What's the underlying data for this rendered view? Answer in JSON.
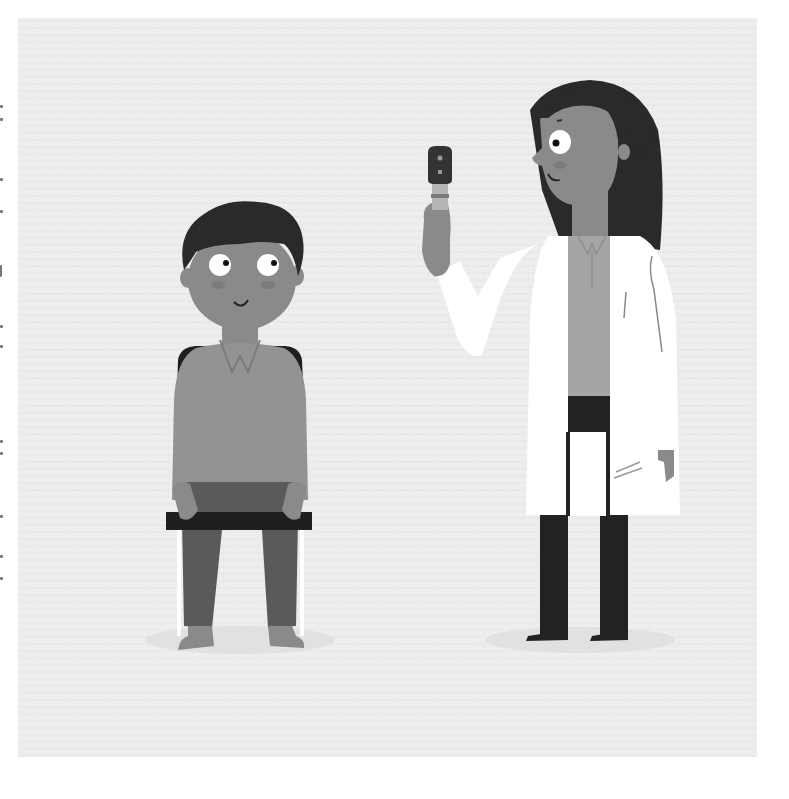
{
  "illustration": {
    "description": "Grayscale illustration of a boy seated on a chair and a female doctor in a white lab coat holding an ophthalmoscope",
    "background_color": "#eeeeee",
    "page_color": "#ffffff",
    "colors": {
      "skin": "#8a8a8a",
      "hair": "#2a2a2a",
      "shirt_boy": "#939393",
      "pants_boy": "#5a5a5a",
      "chair": "#1f1f1f",
      "lab_coat": "#ffffff",
      "doctor_pants": "#222222",
      "doctor_shirt": "#a5a5a5",
      "ground_shadow": "#e2e2e2"
    },
    "figures": [
      {
        "name": "boy",
        "pose": "sitting on chair",
        "expression": "smiling, eyes looking right"
      },
      {
        "name": "doctor",
        "pose": "standing, right arm raised",
        "holding": "ophthalmoscope",
        "expression": "smiling"
      }
    ]
  }
}
